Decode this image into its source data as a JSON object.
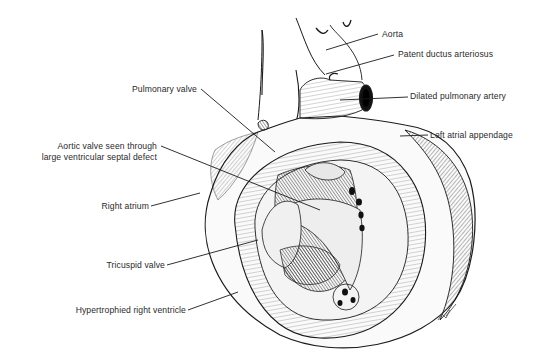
{
  "figure": {
    "ink_color": "#1a1a1a",
    "background": "#ffffff",
    "signature": "signature-mark"
  },
  "labels": {
    "aorta": "Aorta",
    "patent_ductus": "Patent ductus arteriosus",
    "dilated_pulmonary_artery": "Dilated pulmonary artery",
    "left_atrial_appendage": "Left atrial appendage",
    "pulmonary_valve": "Pulmonary valve",
    "aortic_valve_line1": "Aortic valve seen through",
    "aortic_valve_line2": "large ventricular septal defect",
    "right_atrium": "Right atrium",
    "tricuspid_valve": "Tricuspid valve",
    "hypertrophied_rv": "Hypertrophied right ventricle"
  }
}
